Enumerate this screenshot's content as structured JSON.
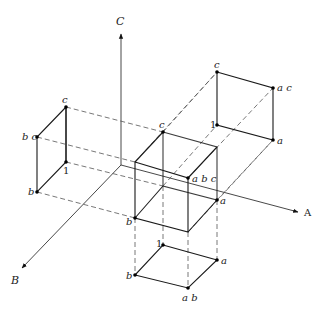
{
  "diagram": {
    "axes": {
      "A": {
        "label": "A"
      },
      "B": {
        "label": "B"
      },
      "C": {
        "label": "C"
      }
    },
    "central_cube": {
      "labels": {
        "c": "c",
        "abc": "a b c",
        "a": "a",
        "b": "b"
      }
    },
    "left_projection": {
      "plane": "B-C",
      "labels": {
        "c": "c",
        "bc": "b c",
        "one": "1",
        "b": "b"
      }
    },
    "right_projection": {
      "plane": "A-C",
      "labels": {
        "c": "c",
        "ac": "a c",
        "one": "1",
        "a": "a"
      }
    },
    "bottom_projection": {
      "plane": "A-B",
      "labels": {
        "one": "1",
        "a": "a",
        "b": "b",
        "ab": "a b"
      }
    }
  }
}
